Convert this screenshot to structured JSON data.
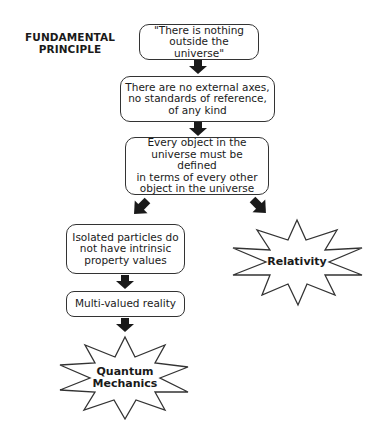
{
  "title": {
    "line1": "FUNDAMENTAL",
    "line2": "PRINCIPLE"
  },
  "boxes": [
    {
      "id": "principle",
      "lines": [
        "\"There is nothing",
        "outside the universe\""
      ]
    },
    {
      "id": "no-axes",
      "lines": [
        "There are no external axes,",
        "no standards of reference,",
        "of any kind"
      ]
    },
    {
      "id": "every-object",
      "lines": [
        "Every object in the",
        "universe must be defined",
        "in terms of every other",
        "object in the universe"
      ]
    },
    {
      "id": "isolated-particles",
      "lines": [
        "Isolated particles do",
        "not have intrinsic",
        "property values"
      ]
    },
    {
      "id": "multi-valued",
      "lines": [
        "Multi-valued reality"
      ]
    }
  ],
  "outcomes": {
    "relativity": {
      "lines": [
        "Relativity"
      ]
    },
    "quantum": {
      "lines": [
        "Quantum",
        "Mechanics"
      ]
    }
  },
  "colors": {
    "stroke": "#333333",
    "arrow": "#1a1a1a",
    "text": "#1a1a1a",
    "background": "#ffffff"
  }
}
